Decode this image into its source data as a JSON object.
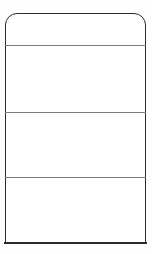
{
  "document": {
    "kind": "blank-form-template",
    "title": "",
    "description": "Blank rectangular form outline with rounded top corners and three horizontal divider rules creating four empty bands."
  },
  "canvas": {
    "width_px": 152,
    "height_px": 254,
    "background_color": "#ffffff"
  },
  "form": {
    "outline": {
      "x_px": 5,
      "y_px": 13,
      "width_px": 141,
      "height_px": 230,
      "stroke_color": "#2b2b2b",
      "stroke_width_px": 1.6,
      "corner_radius_top_px": 12,
      "corner_radius_bottom_px": 0,
      "fill_color": "#ffffff"
    },
    "rules": [
      {
        "name": "rule-1",
        "y_px": 45,
        "color": "#7c7c7c",
        "thickness_px": 1
      },
      {
        "name": "rule-2",
        "y_px": 112,
        "color": "#7c7c7c",
        "thickness_px": 1
      },
      {
        "name": "rule-3",
        "y_px": 177,
        "color": "#7c7c7c",
        "thickness_px": 1
      }
    ],
    "cells": [
      {
        "name": "header-band",
        "label": "",
        "top_px": 15,
        "height_px": 30
      },
      {
        "name": "band-1",
        "label": "",
        "top_px": 46,
        "height_px": 66
      },
      {
        "name": "band-2",
        "label": "",
        "top_px": 113,
        "height_px": 64
      },
      {
        "name": "band-3",
        "label": "",
        "top_px": 178,
        "height_px": 64
      }
    ]
  }
}
